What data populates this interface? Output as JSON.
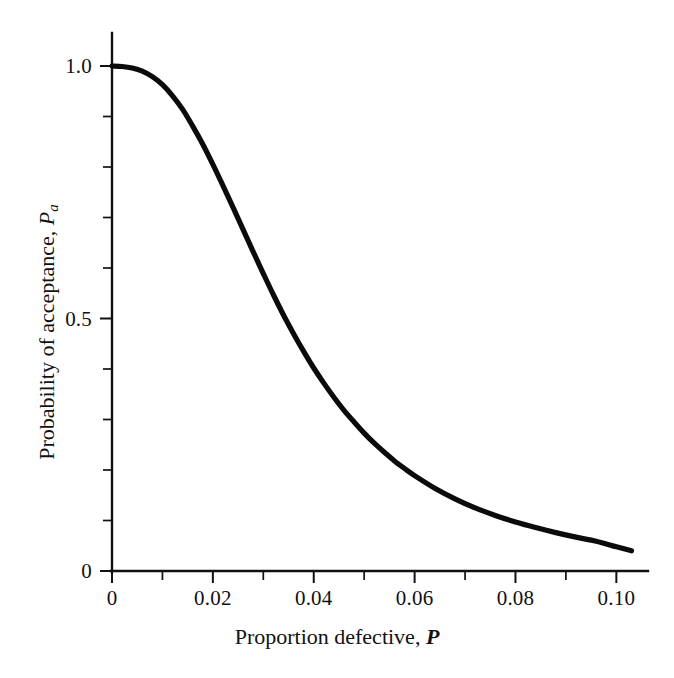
{
  "chart_data": {
    "type": "line",
    "title": "",
    "subtitle": "",
    "xlabel_text": "Proportion defective, ",
    "xlabel_symbol": "P",
    "ylabel_text": "Probability of acceptance, ",
    "ylabel_symbol": "P",
    "ylabel_subscript": "a",
    "xlim": [
      0,
      0.1035
    ],
    "ylim": [
      0,
      1.02
    ],
    "xticks_major": [
      0,
      0.02,
      0.04,
      0.06,
      0.08,
      0.1
    ],
    "xticks_major_labels": [
      "0",
      "0.02",
      "0.04",
      "0.06",
      "0.08",
      "0.10"
    ],
    "xticks_minor": [
      0.01,
      0.03,
      0.05,
      0.07,
      0.09
    ],
    "yticks_major": [
      0,
      0.5,
      1.0
    ],
    "yticks_major_labels": [
      "0",
      "0.5",
      "1.0"
    ],
    "yticks_minor": [
      0.1,
      0.2,
      0.3,
      0.4,
      0.6,
      0.7,
      0.8,
      0.9
    ],
    "grid": false,
    "legend": "none",
    "series": [
      {
        "name": "Operating characteristic curve",
        "color": "#0b0b0b",
        "x": [
          0.0,
          0.002,
          0.004,
          0.006,
          0.008,
          0.01,
          0.012,
          0.014,
          0.016,
          0.018,
          0.02,
          0.022,
          0.024,
          0.026,
          0.028,
          0.03,
          0.032,
          0.034,
          0.036,
          0.038,
          0.04,
          0.042,
          0.044,
          0.046,
          0.048,
          0.05,
          0.052,
          0.054,
          0.056,
          0.058,
          0.06,
          0.064,
          0.068,
          0.072,
          0.076,
          0.08,
          0.084,
          0.088,
          0.092,
          0.096,
          0.1,
          0.103
        ],
        "y": [
          1.0,
          0.999,
          0.996,
          0.99,
          0.979,
          0.963,
          0.941,
          0.914,
          0.881,
          0.845,
          0.805,
          0.763,
          0.72,
          0.676,
          0.632,
          0.589,
          0.547,
          0.507,
          0.47,
          0.435,
          0.402,
          0.372,
          0.344,
          0.318,
          0.295,
          0.273,
          0.253,
          0.235,
          0.218,
          0.203,
          0.189,
          0.164,
          0.143,
          0.125,
          0.11,
          0.097,
          0.086,
          0.076,
          0.067,
          0.059,
          0.048,
          0.04
        ]
      }
    ],
    "annotations": [],
    "notable_points": {
      "p_at_zero": 1.0,
      "p_at_half": 0.035,
      "p_at_end": 0.04
    }
  },
  "figure": {
    "background_color": "#ffffff",
    "axis_color": "#111111",
    "curve_color": "#0b0b0b"
  }
}
